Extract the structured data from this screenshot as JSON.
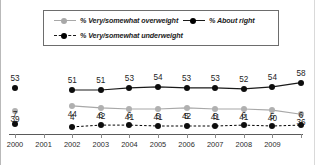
{
  "legend": {
    "items": [
      {
        "label": "% Very/somewhat overweight",
        "key": "overweight",
        "color": "#a8a8a8",
        "style": "solid"
      },
      {
        "label": "% About right",
        "key": "aboutright",
        "color": "#000000",
        "style": "solid"
      },
      {
        "label": "% Very/somewhat underweight",
        "key": "underweight",
        "color": "#000000",
        "style": "dashed"
      }
    ]
  },
  "axis": {
    "tick_labels": [
      "2000",
      "2001",
      "2002",
      "2003",
      "2004",
      "2005",
      "2006",
      "2007",
      "2008",
      "2009"
    ]
  },
  "chart_data": {
    "type": "line",
    "title": "",
    "subtitle": "",
    "xlabel": "",
    "ylabel": "",
    "grid": false,
    "legend_position": "top",
    "ylim": [
      0,
      70
    ],
    "x": [
      "2000",
      "2001",
      "2002",
      "2003",
      "2004",
      "2005",
      "2006",
      "2007",
      "2008",
      "2009",
      "2009b"
    ],
    "tick_labels": [
      "2000",
      "2001",
      "2002",
      "2003",
      "2004",
      "2005",
      "2006",
      "2007",
      "2008",
      "2009"
    ],
    "series": [
      {
        "name": "% About right",
        "color": "#000000",
        "style": "solid",
        "label_position": "above",
        "values": [
          53,
          null,
          51,
          51,
          53,
          54,
          53,
          53,
          52,
          54,
          58
        ]
      },
      {
        "name": "% Very/somewhat overweight",
        "color": "#a8a8a8",
        "style": "solid",
        "label_position": "below",
        "values": [
          39,
          null,
          44,
          42,
          41,
          41,
          42,
          41,
          41,
          40,
          36
        ]
      },
      {
        "name": "% Very/somewhat underweight",
        "color": "#000000",
        "style": "dashed",
        "label_position": "above",
        "values": [
          7,
          null,
          4,
          6,
          6,
          5,
          5,
          5,
          6,
          5,
          6
        ]
      }
    ]
  }
}
